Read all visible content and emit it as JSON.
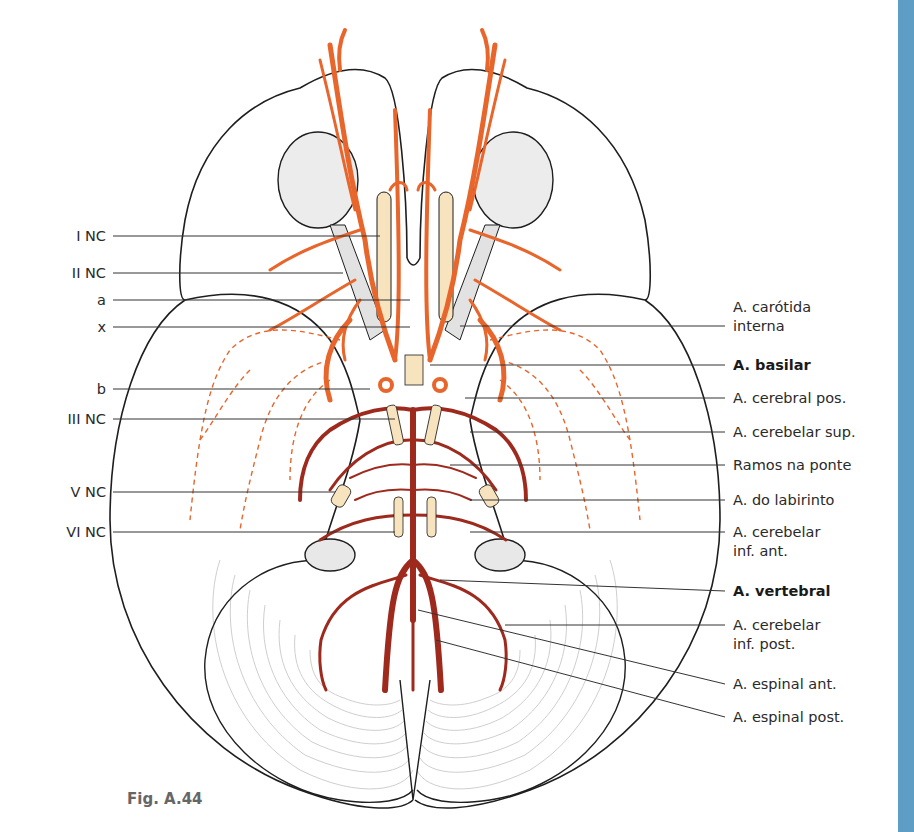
{
  "figure": {
    "caption": "Fig. A.44",
    "colors": {
      "anterior_artery": "#e8652b",
      "posterior_artery": "#9e2a1e",
      "nerve": "#f7e3bd",
      "outline": "#1e1e1e",
      "eye_fill": "#ececec",
      "accent_strip": "#5f9ec4"
    },
    "left_labels": [
      {
        "text": "I NC",
        "y": 236
      },
      {
        "text": "II NC",
        "y": 273
      },
      {
        "text": "a",
        "y": 300
      },
      {
        "text": "x",
        "y": 327
      },
      {
        "text": "b",
        "y": 389
      },
      {
        "text": "III NC",
        "y": 419
      },
      {
        "text": "V NC",
        "y": 492
      },
      {
        "text": "VI NC",
        "y": 532
      }
    ],
    "right_labels": [
      {
        "lines": [
          "A. carótida",
          "interna"
        ],
        "bold": false,
        "y": 326
      },
      {
        "lines": [
          "A. basilar"
        ],
        "bold": true,
        "y": 365
      },
      {
        "lines": [
          "A. cerebral pos."
        ],
        "bold": false,
        "y": 398
      },
      {
        "lines": [
          "A. cerebelar sup."
        ],
        "bold": false,
        "y": 432
      },
      {
        "lines": [
          "Ramos na ponte"
        ],
        "bold": false,
        "y": 465
      },
      {
        "lines": [
          "A. do labirinto"
        ],
        "bold": false,
        "y": 500
      },
      {
        "lines": [
          "A. cerebelar",
          "inf. ant."
        ],
        "bold": false,
        "y": 532
      },
      {
        "lines": [
          "A. vertebral"
        ],
        "bold": true,
        "y": 591
      },
      {
        "lines": [
          "A. cerebelar",
          "inf. post."
        ],
        "bold": false,
        "y": 625
      },
      {
        "lines": [
          "A. espinal ant."
        ],
        "bold": false,
        "y": 684
      },
      {
        "lines": [
          "A. espinal post."
        ],
        "bold": false,
        "y": 717
      }
    ]
  }
}
